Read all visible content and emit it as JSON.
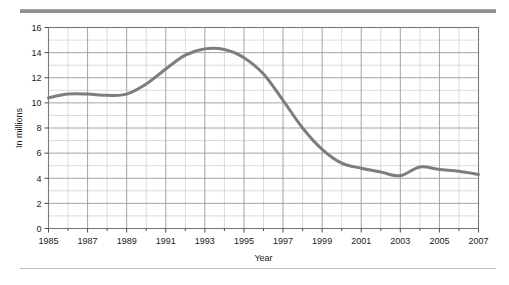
{
  "figure": {
    "top_rule_color": "#8f8f8f",
    "bottom_rule_color": "#bdbdbd",
    "background": "#ffffff"
  },
  "chart_data": {
    "type": "line",
    "title": "",
    "subtitle": "",
    "xlabel": "Year",
    "ylabel": "In millions",
    "xlim": [
      1985,
      2007
    ],
    "ylim": [
      0,
      16
    ],
    "grid": true,
    "legend": null,
    "line_color": "#7d7d7d",
    "line_width": 3,
    "y_ticks": [
      0,
      2,
      4,
      6,
      8,
      10,
      12,
      14,
      16
    ],
    "y_tick_labels": [
      "0",
      "2",
      "4",
      "6",
      "8",
      "10",
      "12",
      "14",
      "16"
    ],
    "y_minor_step": 1,
    "x_ticks": [
      1985,
      1987,
      1989,
      1991,
      1993,
      1995,
      1997,
      1999,
      2001,
      2003,
      2005,
      2007
    ],
    "x_tick_labels": [
      "1985",
      "1987",
      "1989",
      "1991",
      "1993",
      "1995",
      "1997",
      "1999",
      "2001",
      "2003",
      "2005",
      "2007"
    ],
    "x_minor_step": 1,
    "x": [
      1985,
      1986,
      1987,
      1988,
      1989,
      1990,
      1991,
      1992,
      1993,
      1994,
      1995,
      1996,
      1997,
      1998,
      1999,
      2000,
      2001,
      2002,
      2003,
      2004,
      2005,
      2006,
      2007
    ],
    "values": [
      10.4,
      10.7,
      10.7,
      10.6,
      10.7,
      11.5,
      12.7,
      13.8,
      14.3,
      14.25,
      13.6,
      12.3,
      10.2,
      8.0,
      6.3,
      5.2,
      4.8,
      4.5,
      4.2,
      4.9,
      4.7,
      4.55,
      4.3
    ],
    "series": [
      {
        "name": "In millions",
        "values": [
          10.4,
          10.7,
          10.7,
          10.6,
          10.7,
          11.5,
          12.7,
          13.8,
          14.3,
          14.25,
          13.6,
          12.3,
          10.2,
          8.0,
          6.3,
          5.2,
          4.8,
          4.5,
          4.2,
          4.9,
          4.7,
          4.55,
          4.3
        ]
      }
    ],
    "annotations": []
  }
}
